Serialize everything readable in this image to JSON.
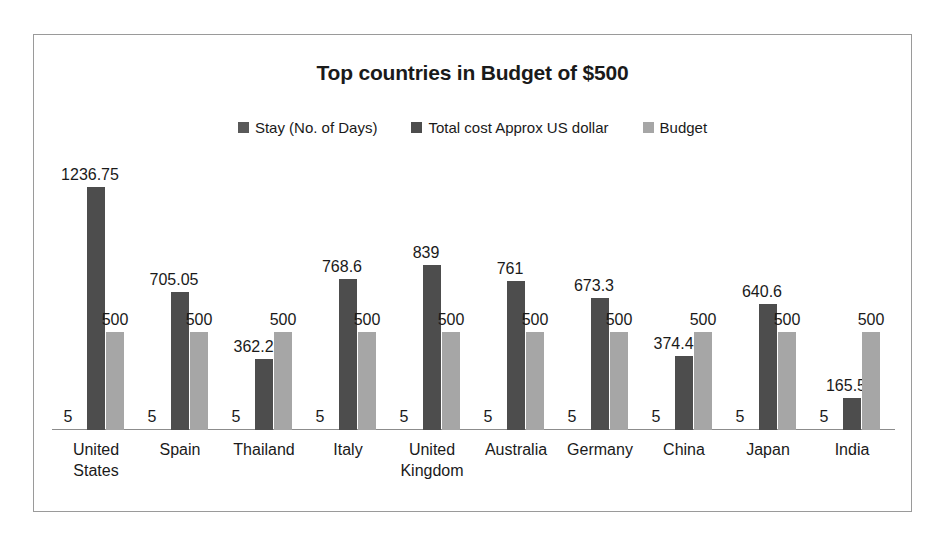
{
  "chart_data": {
    "type": "bar",
    "title": "Top countries in Budget of $500",
    "xlabel": "",
    "ylabel": "",
    "grid": false,
    "legend_position": "top",
    "axis_visible": true,
    "ylim": [
      0,
      1400
    ],
    "categories": [
      "United States",
      "Spain",
      "Thailand",
      "Italy",
      "United Kingdom",
      "Australia",
      "Germany",
      "China",
      "Japan",
      "India"
    ],
    "series": [
      {
        "name": "Stay (No. of Days)",
        "color": "#595959",
        "values": [
          5,
          5,
          5,
          5,
          5,
          5,
          5,
          5,
          5,
          5
        ],
        "labels": [
          "5",
          "5",
          "5",
          "5",
          "5",
          "5",
          "5",
          "5",
          "5",
          "5"
        ]
      },
      {
        "name": "Total cost Approx US dollar",
        "color": "#4d4d4d",
        "values": [
          1236.75,
          705.05,
          362.25,
          768.6,
          839,
          761,
          673.3,
          374.45,
          640.6,
          165.5
        ],
        "labels": [
          "1236.75",
          "705.05",
          "362.25",
          "768.6",
          "839",
          "761",
          "673.3",
          "374.45",
          "640.6",
          "165.5"
        ]
      },
      {
        "name": "Budget",
        "color": "#a6a6a6",
        "values": [
          500,
          500,
          500,
          500,
          500,
          500,
          500,
          500,
          500,
          500
        ],
        "labels": [
          "500",
          "500",
          "500",
          "500",
          "500",
          "500",
          "500",
          "500",
          "500",
          "500"
        ]
      }
    ]
  },
  "frame": {
    "border_color": "#9a9a9a",
    "background": "#ffffff",
    "axis_color": "#8c8c8c"
  }
}
